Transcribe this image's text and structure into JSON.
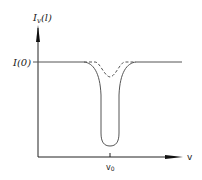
{
  "diagram": {
    "type": "absorption-dip-curve",
    "y_axis_label": "Iv(l)",
    "y_axis_label_main": "I",
    "y_axis_label_sub": "v",
    "y_axis_label_arg": "(l)",
    "baseline_label": "I(0)",
    "x_axis_label": "v",
    "x_tick_label": "v",
    "x_tick_sub": "0",
    "curves": [
      {
        "name": "solid-deep-dip",
        "style": "solid",
        "center": "v0"
      },
      {
        "name": "dashed-shallow-dip",
        "style": "dashed",
        "center": "v0"
      }
    ],
    "colors": {
      "line": "#444444",
      "axis": "#222222",
      "background": "#ffffff"
    }
  }
}
